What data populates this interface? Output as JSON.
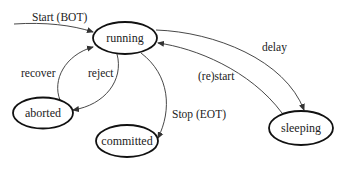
{
  "diagram": {
    "type": "state-transition",
    "colors": {
      "stroke": "#111111",
      "text": "#222222",
      "background": "#ffffff"
    },
    "nodes": [
      {
        "id": "running",
        "label": "running"
      },
      {
        "id": "aborted",
        "label": "aborted"
      },
      {
        "id": "committed",
        "label": "committed"
      },
      {
        "id": "sleeping",
        "label": "sleeping"
      }
    ],
    "edges": [
      {
        "from": "start",
        "to": "running",
        "label": "Start (BOT)"
      },
      {
        "from": "running",
        "to": "sleeping",
        "label": "delay"
      },
      {
        "from": "sleeping",
        "to": "running",
        "label": "(re)start"
      },
      {
        "from": "aborted",
        "to": "running",
        "label": "recover"
      },
      {
        "from": "running",
        "to": "aborted",
        "label": "reject"
      },
      {
        "from": "running",
        "to": "committed",
        "label": "Stop (EOT)"
      }
    ]
  }
}
